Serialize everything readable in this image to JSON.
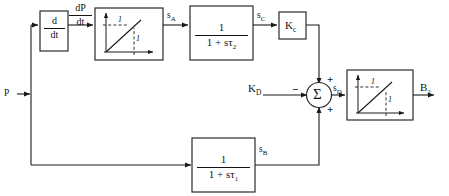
{
  "diagram": {
    "background_color": "#ffffff",
    "line_color": "#1a1a1a",
    "inputs": [
      {
        "id": "P",
        "label": "P"
      },
      {
        "id": "KD",
        "label": "K",
        "sub": "D"
      }
    ],
    "outputs": [
      {
        "id": "B2",
        "label": "B",
        "sub": "2"
      }
    ],
    "blocks": [
      {
        "id": "derivative",
        "type": "transfer-function",
        "numerator": "d",
        "denominator": "dt",
        "name": "derivative-block"
      },
      {
        "id": "limiter-a",
        "type": "saturation",
        "x_mark": "1",
        "y_mark": "1",
        "name": "limiter-block-a"
      },
      {
        "id": "lag-tau2",
        "type": "transfer-function",
        "numerator": "1",
        "denominator": "1 + sτ",
        "denominator_sub": "2",
        "name": "lag-block-tau2"
      },
      {
        "id": "gain-kc",
        "type": "gain",
        "label": "K",
        "sub": "c",
        "name": "gain-block-kc"
      },
      {
        "id": "summing-junction",
        "type": "summer",
        "symbol": "Σ",
        "signs": {
          "left": "−",
          "top": "+",
          "bottom": "+"
        },
        "name": "summing-junction"
      },
      {
        "id": "limiter-b",
        "type": "saturation",
        "x_mark": "1",
        "y_mark": "1",
        "name": "limiter-block-b"
      },
      {
        "id": "lag-tau1",
        "type": "transfer-function",
        "numerator": "1",
        "denominator": "1 + sτ",
        "denominator_sub": "1",
        "name": "lag-block-tau1"
      }
    ],
    "signals": [
      {
        "id": "dPdt",
        "numerator": "dP",
        "denominator": "dt",
        "name": "signal-dp-dt"
      },
      {
        "id": "sA",
        "label": "s",
        "sub": "A",
        "name": "signal-s-a"
      },
      {
        "id": "sC",
        "label": "s",
        "sub": "C",
        "name": "signal-s-c"
      },
      {
        "id": "sD",
        "label": "s",
        "sub": "D",
        "name": "signal-s-d"
      },
      {
        "id": "sB",
        "label": "s",
        "sub": "B",
        "name": "signal-s-b"
      }
    ]
  },
  "labels": {
    "input_p": "P",
    "input_kd_base": "K",
    "input_kd_sub": "D",
    "output_b2_base": "B",
    "output_b2_sub": "2",
    "deriv_num": "d",
    "deriv_den": "dt",
    "dpdt_num": "dP",
    "dpdt_den": "dt",
    "sig_a_base": "s",
    "sig_a_sub": "A",
    "sig_b_base": "s",
    "sig_b_sub": "B",
    "sig_c_base": "s",
    "sig_c_sub": "C",
    "sig_d_base": "s",
    "sig_d_sub": "D",
    "tf2_num": "1",
    "tf2_den": "1 + sτ",
    "tf2_den_sub": "2",
    "tf1_num": "1",
    "tf1_den": "1 + sτ",
    "tf1_den_sub": "1",
    "gain_kc_base": "K",
    "gain_kc_sub": "c",
    "sigma": "Σ",
    "sign_minus": "−",
    "sign_plus_top": "+",
    "sign_plus_bottom": "+",
    "lim_a_y_mark": "1",
    "lim_a_x_mark": "1",
    "lim_b_y_mark": "1",
    "lim_b_x_mark": "1"
  }
}
